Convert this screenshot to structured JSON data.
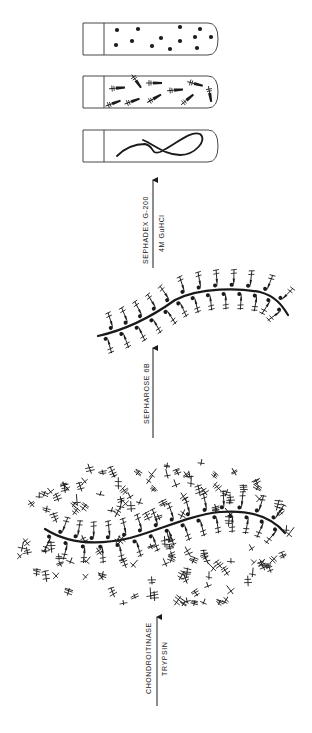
{
  "diagram": {
    "type": "process-flow",
    "direction": "bottom-to-top",
    "ink_color": "#1a1a1a",
    "background": "#ffffff",
    "steps": [
      {
        "id": "aggregate",
        "description": "Proteoglycan aggregate: hyaluronate backbone with attached monomers and glycosaminoglycan chains"
      },
      {
        "id": "arrow-1",
        "labels": [
          "CHONDROITINASE",
          "TRYPSIN"
        ]
      },
      {
        "id": "core",
        "description": "Backbone with trimmed link/core fragments"
      },
      {
        "id": "arrow-2",
        "labels": [
          "SEPHAROSE 6B"
        ]
      },
      {
        "id": "arrow-3",
        "labels": [
          "SEPHADEX G-200",
          "4M GuHCl"
        ]
      },
      {
        "id": "tubes",
        "items": [
          {
            "name": "tube-hyaluronate",
            "content": "loop-strand"
          },
          {
            "name": "tube-fragments",
            "content": "fragments"
          },
          {
            "name": "tube-dots",
            "content": "dots"
          }
        ]
      }
    ],
    "arrows": {
      "chondroitinase": {
        "line1": "CHONDROITINASE",
        "line2": "TRYPSIN"
      },
      "sepharose": {
        "line1": "SEPHAROSE 6B"
      },
      "sephadex": {
        "line1": "SEPHADEX G-200",
        "line2": "4M GuHCl"
      }
    }
  }
}
